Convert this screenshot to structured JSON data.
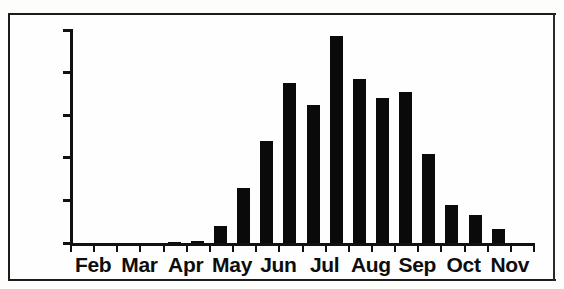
{
  "chart_data": {
    "type": "bar",
    "title": "",
    "subtitle": "",
    "xlabel": "",
    "ylabel": "",
    "ylim": [
      0,
      500
    ],
    "y_ticks": [
      0,
      100,
      200,
      300,
      400,
      500
    ],
    "y_tick_labels": [
      "0",
      "100",
      "200",
      "300",
      "400",
      "500"
    ],
    "grid": false,
    "legend": null,
    "x_tick_labels": [
      "Feb",
      "Mar",
      "Apr",
      "May",
      "Jun",
      "Jul",
      "Aug",
      "Sep",
      "Oct",
      "Nov"
    ],
    "categories": [
      "Feb-1",
      "Feb-2",
      "Mar-1",
      "Mar-2",
      "Apr-1",
      "Apr-2",
      "May-1",
      "May-2",
      "Jun-1",
      "Jun-2",
      "Jul-1",
      "Jul-2",
      "Aug-1",
      "Aug-2",
      "Sep-1",
      "Sep-2",
      "Oct-1",
      "Oct-2",
      "Nov-1",
      "Nov-2"
    ],
    "values": [
      0,
      0,
      0,
      0,
      3,
      5,
      40,
      130,
      240,
      375,
      325,
      485,
      385,
      340,
      355,
      208,
      90,
      65,
      32,
      0
    ],
    "bar_color": "#0a0a0a",
    "axis_color": "#111111",
    "background_color": "#fefefe"
  }
}
